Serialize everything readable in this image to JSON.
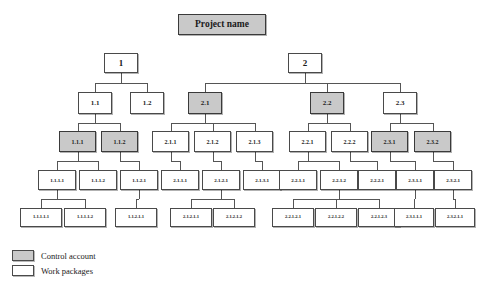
{
  "diagram": {
    "type": "work-breakdown-structure",
    "title_partial": "",
    "root": {
      "id": "root",
      "label": "Project name",
      "kind": "control-account",
      "level": 0
    },
    "levels": [
      {
        "level": 1,
        "nodes": [
          {
            "id": "1",
            "label": "1",
            "kind": "work-package"
          },
          {
            "id": "2",
            "label": "2",
            "kind": "work-package"
          }
        ]
      },
      {
        "level": 2,
        "nodes": [
          {
            "id": "1.1",
            "label": "1.1",
            "kind": "work-package",
            "parent": "1"
          },
          {
            "id": "1.2",
            "label": "1.2",
            "kind": "work-package",
            "parent": "1"
          },
          {
            "id": "2.1",
            "label": "2.1",
            "kind": "control-account",
            "parent": "2"
          },
          {
            "id": "2.2",
            "label": "2.2",
            "kind": "control-account",
            "parent": "2"
          },
          {
            "id": "2.3",
            "label": "2.3",
            "kind": "work-package",
            "parent": "2"
          }
        ]
      },
      {
        "level": 3,
        "nodes": [
          {
            "id": "1.1.1",
            "label": "1.1.1",
            "kind": "control-account",
            "parent": "1.1"
          },
          {
            "id": "1.1.2",
            "label": "1.1.2",
            "kind": "control-account",
            "parent": "1.1"
          },
          {
            "id": "2.1.1",
            "label": "2.1.1",
            "kind": "work-package",
            "parent": "2.1"
          },
          {
            "id": "2.1.2",
            "label": "2.1.2",
            "kind": "work-package",
            "parent": "2.1"
          },
          {
            "id": "2.1.3",
            "label": "2.1.3",
            "kind": "work-package",
            "parent": "2.1"
          },
          {
            "id": "2.2.1",
            "label": "2.2.1",
            "kind": "work-package",
            "parent": "2.2"
          },
          {
            "id": "2.2.2",
            "label": "2.2.2",
            "kind": "work-package",
            "parent": "2.2"
          },
          {
            "id": "2.3.1",
            "label": "2.3.1",
            "kind": "control-account",
            "parent": "2.3"
          },
          {
            "id": "2.3.2",
            "label": "2.3.2",
            "kind": "control-account",
            "parent": "2.3"
          }
        ]
      },
      {
        "level": 4,
        "nodes": [
          {
            "id": "1.1.1.1",
            "label": "1.1.1.1",
            "kind": "work-package",
            "parent": "1.1.1"
          },
          {
            "id": "1.1.1.2",
            "label": "1.1.1.2",
            "kind": "work-package",
            "parent": "1.1.1"
          },
          {
            "id": "1.1.2.1",
            "label": "1.1.2.1",
            "kind": "work-package",
            "parent": "1.1.2"
          },
          {
            "id": "2.1.1.1",
            "label": "2.1.1.1",
            "kind": "work-package",
            "parent": "2.1.1"
          },
          {
            "id": "2.1.2.1",
            "label": "2.1.2.1",
            "kind": "work-package",
            "parent": "2.1.2"
          },
          {
            "id": "2.1.3.1",
            "label": "2.1.3.1",
            "kind": "work-package",
            "parent": "2.1.3"
          },
          {
            "id": "2.2.1.1",
            "label": "2.2.1.1",
            "kind": "work-package",
            "parent": "2.2.1"
          },
          {
            "id": "2.2.1.2",
            "label": "2.2.1.2",
            "kind": "work-package",
            "parent": "2.2.1"
          },
          {
            "id": "2.2.2.1",
            "label": "2.2.2.1",
            "kind": "work-package",
            "parent": "2.2.2"
          },
          {
            "id": "2.3.1.1",
            "label": "2.3.1.1",
            "kind": "work-package",
            "parent": "2.3.1"
          },
          {
            "id": "2.3.2.1",
            "label": "2.3.2.1",
            "kind": "work-package",
            "parent": "2.3.2"
          }
        ]
      },
      {
        "level": 5,
        "nodes": [
          {
            "id": "1.1.1.1.1",
            "label": "1.1.1.1.1",
            "kind": "work-package",
            "parent": "1.1.1.1"
          },
          {
            "id": "1.1.1.1.2",
            "label": "1.1.1.1.2",
            "kind": "work-package",
            "parent": "1.1.1.1"
          },
          {
            "id": "1.1.2.1.1",
            "label": "1.1.2.1.1",
            "kind": "work-package",
            "parent": "1.1.2.1"
          },
          {
            "id": "2.1.2.1.1",
            "label": "2.1.2.1.1",
            "kind": "work-package",
            "parent": "2.1.2.1"
          },
          {
            "id": "2.1.2.1.2",
            "label": "2.1.2.1.2",
            "kind": "work-package",
            "parent": "2.1.2.1"
          },
          {
            "id": "2.2.1.2.1",
            "label": "2.2.1.2.1",
            "kind": "work-package",
            "parent": "2.2.1.2"
          },
          {
            "id": "2.2.1.2.2",
            "label": "2.2.1.2.2",
            "kind": "work-package",
            "parent": "2.2.1.2"
          },
          {
            "id": "2.2.1.2.3",
            "label": "2.2.1.2.3",
            "kind": "work-package",
            "parent": "2.2.1.2"
          },
          {
            "id": "2.3.1.1.1",
            "label": "2.3.1.1.1",
            "kind": "work-package",
            "parent": "2.3.1.1"
          },
          {
            "id": "2.3.2.1.1",
            "label": "2.3.2.1.1",
            "kind": "work-package",
            "parent": "2.3.2.1"
          }
        ]
      }
    ]
  },
  "legend": {
    "items": [
      {
        "key": "control-account",
        "label": "Control account",
        "color": "#c9c9c9"
      },
      {
        "key": "work-package",
        "label": "Work packages",
        "color": "#ffffff"
      }
    ]
  },
  "colors": {
    "control_account_fill": "#c9c9c9",
    "work_package_fill": "#ffffff",
    "border": "#4a4a4a",
    "connector": "#555555",
    "background": "#ffffff"
  }
}
